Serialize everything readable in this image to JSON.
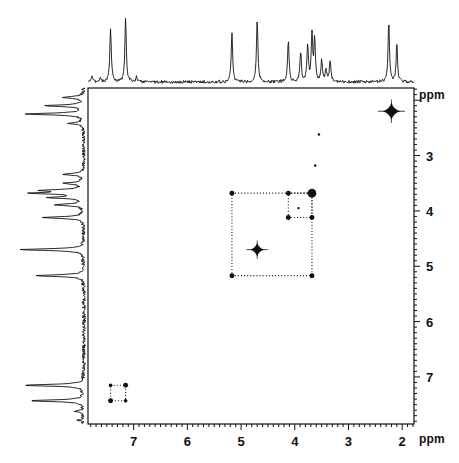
{
  "figure": {
    "kind": "2D NMR COSY contour plot with 1D projections",
    "axis_unit_label_right": "ppm",
    "axis_unit_label_bottom": "ppm"
  },
  "chart_data": {
    "type": "scatter",
    "title": "",
    "xlabel": "ppm",
    "ylabel": "ppm",
    "xlim": [
      7.85,
      1.78
    ],
    "ylim": [
      1.78,
      7.85
    ],
    "grid": false,
    "legend_position": "none",
    "x_ticks": [
      7,
      6,
      5,
      4,
      3,
      2
    ],
    "x_tick_labels": [
      "7",
      "6",
      "5",
      "4",
      "3",
      "2"
    ],
    "y_ticks": [
      3,
      4,
      5,
      6,
      7
    ],
    "y_tick_labels": [
      "3",
      "4",
      "5",
      "6",
      "7"
    ],
    "diagonal_peaks": [
      {
        "name": "diag-2p20",
        "x": 2.2,
        "y": 2.2,
        "size": 14,
        "shape": "star"
      },
      {
        "name": "diag-4p70",
        "x": 4.7,
        "y": 4.7,
        "size": 11,
        "shape": "star"
      },
      {
        "name": "diag-3p68",
        "x": 3.68,
        "y": 3.68,
        "size": 7,
        "shape": "blob"
      },
      {
        "name": "diag-7p43",
        "x": 7.43,
        "y": 7.43,
        "size": 4,
        "shape": "blob"
      },
      {
        "name": "diag-7p15",
        "x": 7.15,
        "y": 7.15,
        "size": 4,
        "shape": "blob"
      },
      {
        "name": "diag-5p17",
        "x": 5.17,
        "y": 5.17,
        "size": 4,
        "shape": "blob"
      },
      {
        "name": "diag-4p12",
        "x": 4.12,
        "y": 4.12,
        "size": 4,
        "shape": "blob"
      }
    ],
    "cross_peaks": [
      {
        "name": "cp-5p17-3p68",
        "x": 5.17,
        "y": 3.68,
        "size": 4
      },
      {
        "name": "cp-3p68-5p17",
        "x": 3.68,
        "y": 5.17,
        "size": 4
      },
      {
        "name": "cp-4p12-3p68",
        "x": 4.12,
        "y": 3.68,
        "size": 4
      },
      {
        "name": "cp-3p68-4p12",
        "x": 3.68,
        "y": 4.12,
        "size": 4
      },
      {
        "name": "cp-4p12-4p12",
        "x": 4.12,
        "y": 4.12,
        "size": 3
      },
      {
        "name": "cp-3p90-3p98",
        "x": 3.93,
        "y": 3.95,
        "size": 2
      },
      {
        "name": "cp-7p43-7p15",
        "x": 7.43,
        "y": 7.15,
        "size": 3
      },
      {
        "name": "cp-7p15-7p43",
        "x": 7.15,
        "y": 7.43,
        "size": 3
      },
      {
        "name": "cp-7p43-7p43",
        "x": 7.43,
        "y": 7.43,
        "size": 3
      },
      {
        "name": "cp-7p15-7p15",
        "x": 7.15,
        "y": 7.15,
        "size": 3
      },
      {
        "name": "cp-3p55-2p62",
        "x": 3.55,
        "y": 2.62,
        "size": 2
      },
      {
        "name": "cp-3p62-3p18",
        "x": 3.62,
        "y": 3.18,
        "size": 2
      }
    ],
    "connectivity_boxes": [
      {
        "name": "box-outer-spin-system",
        "x1": 5.17,
        "x2": 3.68,
        "y1": 3.68,
        "y2": 5.17,
        "style": "dotted"
      },
      {
        "name": "box-inner-spin-system",
        "x1": 4.12,
        "x2": 3.68,
        "y1": 3.68,
        "y2": 4.12,
        "style": "dotted"
      },
      {
        "name": "box-aromatic-spin-system",
        "x1": 7.43,
        "x2": 7.15,
        "y1": 7.15,
        "y2": 7.43,
        "style": "dotted"
      }
    ],
    "f2_projection_peaks": [
      {
        "ppm": 7.78,
        "height": 0.07
      },
      {
        "ppm": 7.62,
        "height": 0.06
      },
      {
        "ppm": 7.43,
        "height": 0.8
      },
      {
        "ppm": 7.15,
        "height": 0.92
      },
      {
        "ppm": 6.95,
        "height": 0.07
      },
      {
        "ppm": 5.17,
        "height": 0.72
      },
      {
        "ppm": 4.7,
        "height": 0.93
      },
      {
        "ppm": 4.12,
        "height": 0.62
      },
      {
        "ppm": 3.89,
        "height": 0.44
      },
      {
        "ppm": 3.76,
        "height": 0.52
      },
      {
        "ppm": 3.68,
        "height": 0.7
      },
      {
        "ppm": 3.63,
        "height": 0.6
      },
      {
        "ppm": 3.5,
        "height": 0.3
      },
      {
        "ppm": 3.42,
        "height": 0.18
      },
      {
        "ppm": 3.34,
        "height": 0.33
      },
      {
        "ppm": 2.25,
        "height": 0.88
      },
      {
        "ppm": 2.1,
        "height": 0.55
      }
    ],
    "f1_projection_peaks": [
      {
        "ppm": 1.95,
        "height": 0.3
      },
      {
        "ppm": 2.1,
        "height": 0.55
      },
      {
        "ppm": 2.25,
        "height": 0.85
      },
      {
        "ppm": 2.42,
        "height": 0.2
      },
      {
        "ppm": 3.34,
        "height": 0.3
      },
      {
        "ppm": 3.5,
        "height": 0.28
      },
      {
        "ppm": 3.63,
        "height": 0.55
      },
      {
        "ppm": 3.68,
        "height": 0.72
      },
      {
        "ppm": 3.76,
        "height": 0.48
      },
      {
        "ppm": 3.89,
        "height": 0.42
      },
      {
        "ppm": 4.12,
        "height": 0.6
      },
      {
        "ppm": 4.7,
        "height": 0.92
      },
      {
        "ppm": 5.17,
        "height": 0.7
      },
      {
        "ppm": 7.15,
        "height": 0.88
      },
      {
        "ppm": 7.43,
        "height": 0.78
      },
      {
        "ppm": 7.62,
        "height": 0.12
      },
      {
        "ppm": 7.78,
        "height": 0.08
      }
    ]
  }
}
